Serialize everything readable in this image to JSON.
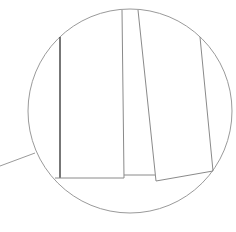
{
  "diagram": {
    "type": "detail-callout",
    "colors": {
      "background": "#ffffff",
      "circle_stroke": "#9a9a9a",
      "line_stroke": "#8a8a8a",
      "dark_line_stroke": "#4a4a4a"
    },
    "circle": {
      "cx": 130,
      "cy": 111,
      "r": 102
    },
    "leader_line": {
      "x1": 0,
      "y1": 166,
      "x2": 35,
      "y2": 153
    },
    "segments": [
      {
        "id": "left-vertical",
        "x1": 60,
        "y1": 37,
        "x2": 60,
        "y2": 178,
        "dark": true
      },
      {
        "id": "center-vertical",
        "x1": 122,
        "y1": 10,
        "x2": 124,
        "y2": 178,
        "dark": false
      },
      {
        "id": "bottom-left-edge",
        "x1": 55,
        "y1": 178,
        "x2": 124,
        "y2": 178,
        "dark": false
      },
      {
        "id": "step-edge",
        "x1": 124,
        "y1": 175,
        "x2": 155,
        "y2": 175,
        "dark": false
      },
      {
        "id": "slanted-left",
        "x1": 138,
        "y1": 10,
        "x2": 156,
        "y2": 181,
        "dark": false
      },
      {
        "id": "bottom-right-edge",
        "x1": 156,
        "y1": 181,
        "x2": 213,
        "y2": 171,
        "dark": false
      },
      {
        "id": "slanted-right",
        "x1": 200,
        "y1": 37,
        "x2": 213,
        "y2": 171,
        "dark": false
      }
    ]
  }
}
